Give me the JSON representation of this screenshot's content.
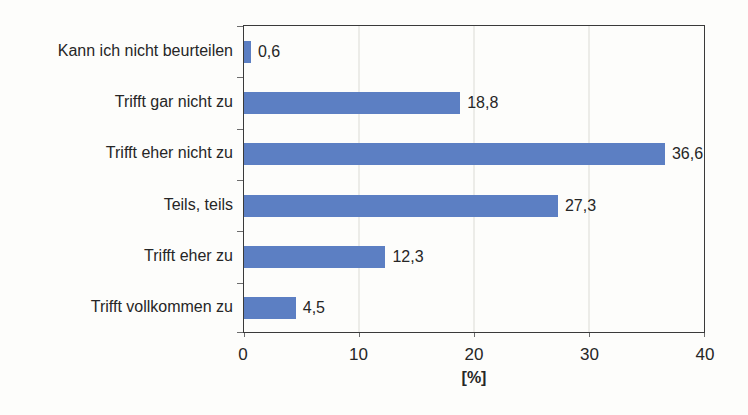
{
  "chart_data": {
    "type": "bar",
    "orientation": "horizontal",
    "title": "",
    "xlabel": "[%]",
    "ylabel": "",
    "categories": [
      "Kann ich nicht beurteilen",
      "Trifft gar nicht zu",
      "Trifft eher nicht zu",
      "Teils, teils",
      "Trifft eher zu",
      "Trifft vollkommen zu"
    ],
    "values": [
      0.6,
      18.8,
      36.6,
      27.3,
      12.3,
      4.5
    ],
    "value_labels": [
      "0,6",
      "18,8",
      "36,6",
      "27,3",
      "12,3",
      "4,5"
    ],
    "xlim": [
      0,
      40
    ],
    "x_ticks": [
      0,
      10,
      20,
      30,
      40
    ],
    "x_tick_labels": [
      "0",
      "10",
      "20",
      "30",
      "40"
    ],
    "grid": true,
    "gridlines_at": [
      10,
      20,
      30
    ],
    "legend": false,
    "colors": {
      "bar": "#5c7fc3",
      "axis": "#3a3a3a",
      "gridline": "#dcdcd6",
      "text": "#262626"
    }
  }
}
